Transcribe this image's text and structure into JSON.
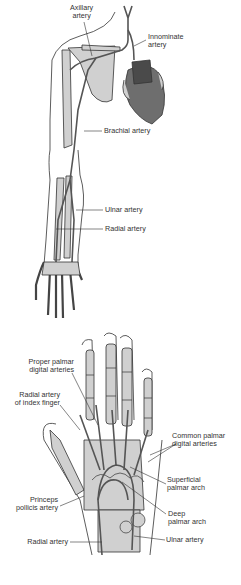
{
  "colors": {
    "background": "#ffffff",
    "outline": "#333333",
    "bone": "#d0d0d0",
    "artery": "#555555",
    "heart": "#6e6e6e",
    "heart_dark": "#4a4a4a",
    "label_text": "#333333"
  },
  "arm_figure": {
    "labels": {
      "axillary": [
        "Axillary",
        "artery"
      ],
      "innominate": [
        "Innominate",
        "artery"
      ],
      "brachial": "Brachial artery",
      "ulnar": "Ulnar artery",
      "radial": "Radial artery"
    }
  },
  "hand_figure": {
    "labels": {
      "proper_palmar": [
        "Proper palmar",
        "digital arteries"
      ],
      "radial_index": [
        "Radial artery",
        "of index finger"
      ],
      "common_palmar": [
        "Common palmar",
        "digital arteries"
      ],
      "superficial_arch": [
        "Superficial",
        "palmar arch"
      ],
      "deep_arch": [
        "Deep",
        "palmar arch"
      ],
      "princeps": [
        "Princeps",
        "pollicis artery"
      ],
      "radial": "Radial artery",
      "ulnar": "Ulnar artery"
    }
  }
}
